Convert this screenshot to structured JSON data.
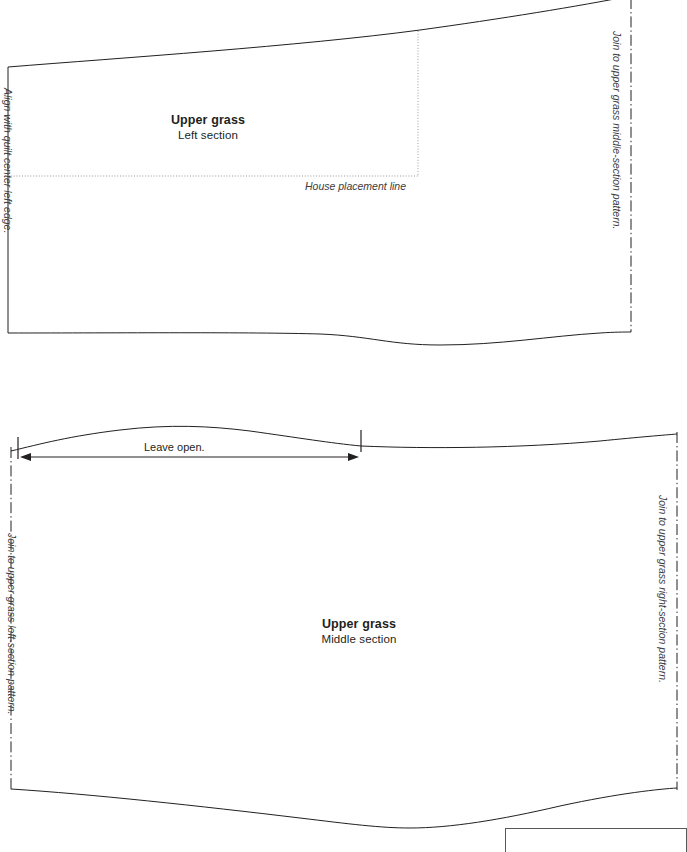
{
  "document": {
    "type": "quilt-applique-pattern-sheet",
    "background_color": "#ffffff",
    "line_color": "#231f20",
    "guide_color": "#8b8b8e"
  },
  "pieces": [
    {
      "id": "upper-grass-left",
      "title": "Upper grass",
      "subtitle": "Left section",
      "left_edge_note": "Align with quilt center left edge.\nDo not add seam allowance to this edge if\nyou're using a turned-edge appliqué method.",
      "right_edge_note": "Join to upper grass middle-section pattern.",
      "placement_line_label": "House placement line"
    },
    {
      "id": "upper-grass-middle",
      "title": "Upper grass",
      "subtitle": "Middle section",
      "left_edge_note": "Join to upper grass left-section pattern.",
      "right_edge_note": "Join to upper grass right-section pattern.",
      "open_segment_label": "Leave open."
    }
  ],
  "corner_note": {
    "text": "Patterns do not include"
  }
}
